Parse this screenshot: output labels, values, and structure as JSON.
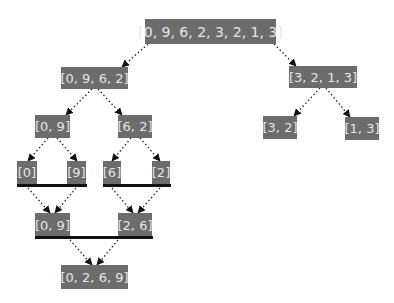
{
  "diagram": {
    "colors": {
      "node_bg": "#6c6c6c",
      "node_text": "#e6e6e6",
      "edge": "#222222",
      "merge_bar": "#111111"
    },
    "nodes": [
      {
        "id": "n0",
        "label": "[0, 9, 6, 2, 3, 2, 1, 3]",
        "x": 145,
        "y": 19,
        "w": 131,
        "h": 25
      },
      {
        "id": "n1",
        "label": "[0, 9, 6, 2]",
        "x": 61,
        "y": 67,
        "w": 67,
        "h": 22
      },
      {
        "id": "n2",
        "label": "[3, 2, 1, 3]",
        "x": 289,
        "y": 66,
        "w": 68,
        "h": 22
      },
      {
        "id": "n3",
        "label": "[0, 9]",
        "x": 35,
        "y": 115,
        "w": 35,
        "h": 23
      },
      {
        "id": "n4",
        "label": "[6, 2]",
        "x": 118,
        "y": 115,
        "w": 34,
        "h": 23
      },
      {
        "id": "n5",
        "label": "[3, 2]",
        "x": 263,
        "y": 116,
        "w": 34,
        "h": 23
      },
      {
        "id": "n6",
        "label": "[1, 3]",
        "x": 345,
        "y": 117,
        "w": 34,
        "h": 23
      },
      {
        "id": "n7",
        "label": "[0]",
        "x": 17,
        "y": 161,
        "w": 20,
        "h": 23
      },
      {
        "id": "n8",
        "label": "[9]",
        "x": 67,
        "y": 161,
        "w": 19,
        "h": 23
      },
      {
        "id": "n9",
        "label": "[6]",
        "x": 103,
        "y": 161,
        "w": 18,
        "h": 23
      },
      {
        "id": "n10",
        "label": "[2]",
        "x": 152,
        "y": 161,
        "w": 18,
        "h": 23
      },
      {
        "id": "n11",
        "label": "[0, 9]",
        "x": 35,
        "y": 213,
        "w": 35,
        "h": 24
      },
      {
        "id": "n12",
        "label": "[2, 6]",
        "x": 118,
        "y": 213,
        "w": 34,
        "h": 24
      },
      {
        "id": "n13",
        "label": "[0, 2, 6, 9]",
        "x": 61,
        "y": 265,
        "w": 67,
        "h": 24
      }
    ],
    "edges": [
      {
        "from": "n0",
        "to": "n1",
        "x1": 148,
        "y1": 44,
        "x2": 122,
        "y2": 67
      },
      {
        "from": "n0",
        "to": "n2",
        "x1": 274,
        "y1": 44,
        "x2": 296,
        "y2": 66
      },
      {
        "from": "n1",
        "to": "n3",
        "x1": 92,
        "y1": 89,
        "x2": 66,
        "y2": 115
      },
      {
        "from": "n1",
        "to": "n4",
        "x1": 98,
        "y1": 89,
        "x2": 122,
        "y2": 115
      },
      {
        "from": "n2",
        "to": "n5",
        "x1": 320,
        "y1": 88,
        "x2": 294,
        "y2": 116
      },
      {
        "from": "n2",
        "to": "n6",
        "x1": 326,
        "y1": 88,
        "x2": 350,
        "y2": 117
      },
      {
        "from": "n3",
        "to": "n7",
        "x1": 48,
        "y1": 138,
        "x2": 28,
        "y2": 161
      },
      {
        "from": "n3",
        "to": "n8",
        "x1": 57,
        "y1": 138,
        "x2": 77,
        "y2": 161
      },
      {
        "from": "n4",
        "to": "n9",
        "x1": 131,
        "y1": 138,
        "x2": 112,
        "y2": 161
      },
      {
        "from": "n4",
        "to": "n10",
        "x1": 140,
        "y1": 138,
        "x2": 160,
        "y2": 161
      },
      {
        "from": "n7",
        "to": "n11",
        "x1": 28,
        "y1": 188,
        "x2": 50,
        "y2": 213
      },
      {
        "from": "n8",
        "to": "n11",
        "x1": 76,
        "y1": 188,
        "x2": 55,
        "y2": 213
      },
      {
        "from": "n9",
        "to": "n12",
        "x1": 112,
        "y1": 188,
        "x2": 133,
        "y2": 213
      },
      {
        "from": "n10",
        "to": "n12",
        "x1": 160,
        "y1": 188,
        "x2": 138,
        "y2": 213
      },
      {
        "from": "n11",
        "to": "n13",
        "x1": 70,
        "y1": 240,
        "x2": 92,
        "y2": 265
      },
      {
        "from": "n12",
        "to": "n13",
        "x1": 118,
        "y1": 240,
        "x2": 97,
        "y2": 265
      }
    ],
    "merge_bars": [
      {
        "x": 17,
        "y": 184,
        "w": 70
      },
      {
        "x": 103,
        "y": 184,
        "w": 68
      },
      {
        "x": 35,
        "y": 236,
        "w": 118
      }
    ]
  }
}
